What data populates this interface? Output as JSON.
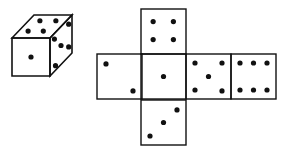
{
  "colors": {
    "ink": "#111111",
    "paper": "#ffffff"
  },
  "cube": {
    "visible_faces": [
      {
        "face": "front",
        "pips": 1
      },
      {
        "face": "top",
        "pips": 4
      },
      {
        "face": "right",
        "pips": 5
      }
    ]
  },
  "net": {
    "faces": [
      {
        "id": "top",
        "pips": 4
      },
      {
        "id": "left",
        "pips": 2
      },
      {
        "id": "center",
        "pips": 1
      },
      {
        "id": "right",
        "pips": 5
      },
      {
        "id": "far-right",
        "pips": 6
      },
      {
        "id": "bottom",
        "pips": 3
      }
    ]
  }
}
